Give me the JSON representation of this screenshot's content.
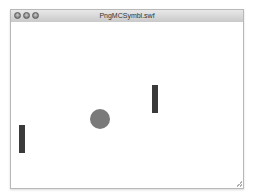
{
  "window": {
    "title": "PngMCSymbl.swf",
    "controls": [
      "close",
      "minimize",
      "zoom"
    ]
  },
  "stage": {
    "background": "#ffffff",
    "left_paddle": {
      "x": 8,
      "y": 103,
      "width": 6,
      "height": 28,
      "color": "#3a3a3a"
    },
    "right_paddle": {
      "x": 141,
      "y": 63,
      "width": 6,
      "height": 28,
      "color": "#3a3a3a"
    },
    "ball": {
      "x": 79,
      "y": 87,
      "diameter": 20,
      "color": "#7a7a7a"
    }
  }
}
